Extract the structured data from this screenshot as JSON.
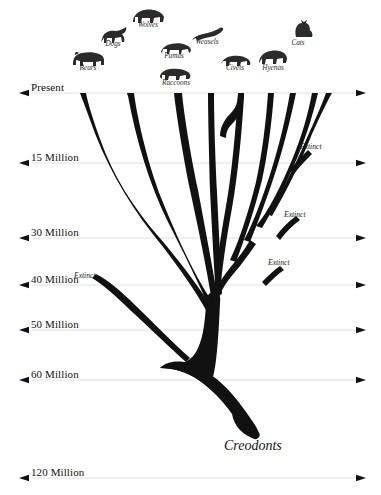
{
  "diagram": {
    "type": "phylogenetic-tree",
    "root_label": "Creodonts",
    "background": "#ffffff",
    "branch_color": "#111111",
    "gridline_color": "#d8d8d8"
  },
  "time_axis": {
    "orientation": "horizontal-gridlines",
    "unit": "years before present",
    "ticks": [
      {
        "label": "Present",
        "y": 93,
        "value": 0
      },
      {
        "label": "15 Million",
        "y": 163,
        "value": 15000000
      },
      {
        "label": "30 Million",
        "y": 238,
        "value": 30000000
      },
      {
        "label": "40 Million",
        "y": 285,
        "value": 40000000
      },
      {
        "label": "50 Million",
        "y": 330,
        "value": 50000000
      },
      {
        "label": "60 Million",
        "y": 380,
        "value": 60000000
      },
      {
        "label": "120 Million",
        "y": 478,
        "value": 120000000
      }
    ]
  },
  "taxa": [
    {
      "label": "Bears",
      "icon": "bear-icon",
      "x": 88,
      "y": 70,
      "icon_x": 70,
      "icon_y": 47
    },
    {
      "label": "Dogs",
      "icon": "dog-icon",
      "x": 113,
      "y": 46,
      "icon_x": 97,
      "icon_y": 25
    },
    {
      "label": "Wolves",
      "icon": "wolf-icon",
      "x": 148,
      "y": 27,
      "icon_x": 130,
      "icon_y": 5
    },
    {
      "label": "Pumas",
      "icon": "puma-icon",
      "x": 174,
      "y": 58,
      "icon_x": 158,
      "icon_y": 37
    },
    {
      "label": "Raccoons",
      "icon": "raccoon-icon",
      "x": 176,
      "y": 85,
      "icon_x": 157,
      "icon_y": 62
    },
    {
      "label": "Weasels",
      "icon": "weasel-icon",
      "x": 207,
      "y": 44,
      "icon_x": 190,
      "icon_y": 24
    },
    {
      "label": "Civets",
      "icon": "civet-icon",
      "x": 235,
      "y": 70,
      "icon_x": 218,
      "icon_y": 49
    },
    {
      "label": "Hyenas",
      "icon": "hyena-icon",
      "x": 273,
      "y": 70,
      "icon_x": 255,
      "icon_y": 45
    },
    {
      "label": "Cats",
      "icon": "cat-icon",
      "x": 298,
      "y": 45,
      "icon_x": 288,
      "icon_y": 18
    }
  ],
  "extinct_branches": [
    {
      "label": "Extinct",
      "x": 74,
      "y": 271
    },
    {
      "label": "Extinct",
      "x": 300,
      "y": 142
    },
    {
      "label": "Extinct",
      "x": 284,
      "y": 210
    },
    {
      "label": "Extinct",
      "x": 268,
      "y": 258
    }
  ]
}
